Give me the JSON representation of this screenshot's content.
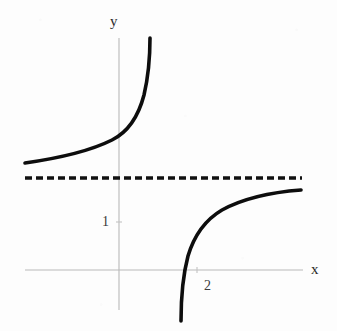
{
  "figure": {
    "width": 337,
    "height": 331,
    "background_color": "#fdfdfd"
  },
  "chart_data": {
    "type": "line",
    "title": "",
    "subtitle": "",
    "xlabel": "x",
    "ylabel": "y",
    "grid": false,
    "legend": null,
    "xlim": [
      -2.4,
      4.1
    ],
    "ylim": [
      -1.6,
      4.4
    ],
    "axis_style": {
      "color": "#b9b9b9",
      "width_px": 1,
      "x_axis_pixel_y": 270,
      "y_axis_pixel_x": 119,
      "x_axis_pixel_span": [
        25,
        303
      ],
      "y_axis_pixel_span": [
        38,
        310
      ]
    },
    "ticks": {
      "x": [
        {
          "value": 2,
          "label": "2",
          "pixel_x": 197
        }
      ],
      "y": [
        {
          "value": 1,
          "label": "1",
          "pixel_y": 222
        }
      ]
    },
    "annotations": [
      {
        "name": "horizontal-asymptote",
        "kind": "dashed-horizontal-line",
        "y_value": 1.9,
        "pixel_y": 178,
        "pixel_x_start": 25,
        "pixel_x_end": 302,
        "color": "#111111",
        "stroke_width_px": 3.4,
        "dash_pattern_px": "7 4"
      }
    ],
    "series": [
      {
        "name": "branch-left",
        "description": "Left branch of the rational curve; increases from just above the horizontal asymptote on the far left and rises steeply toward the vertical asymptote.",
        "color": "#0d0d0d",
        "stroke_width_px": 3.6,
        "path": "M 25,163 C 60,158 92,150 112,140 C 128,132 138,118 144,95 C 148,78 150,56 150,38"
      },
      {
        "name": "branch-right",
        "description": "Right branch of the rational curve; rises from far below, crosses the x-axis near x = 2, and flattens toward the horizontal asymptote on the right.",
        "color": "#0d0d0d",
        "stroke_width_px": 3.6,
        "path": "M 181,321 C 181,300 183,275 188,256 C 194,236 205,220 222,210 C 244,198 274,192 301,190"
      }
    ]
  },
  "labels": {
    "y_axis": "y",
    "x_axis": "x",
    "tick_1": "1",
    "tick_2": "2"
  }
}
